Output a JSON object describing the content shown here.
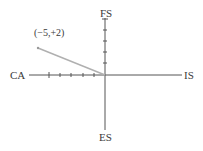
{
  "diagram": {
    "axes": {
      "left_label": "CA",
      "right_label": "IS",
      "top_label": "FS",
      "bottom_label": "ES"
    },
    "point": {
      "label": "(−5,+2)",
      "x": -5,
      "y": 2
    },
    "colors": {
      "axis": "#555555",
      "vector": "#b0b0b0",
      "text": "#3a3a3a"
    }
  }
}
